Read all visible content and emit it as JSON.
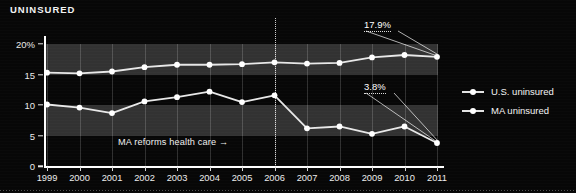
{
  "chart": {
    "title": "UNINSURED"
  },
  "chart_data": {
    "type": "line",
    "title": "UNINSURED",
    "xlabel": "",
    "ylabel": "",
    "x": [
      1999,
      2000,
      2001,
      2002,
      2003,
      2004,
      2005,
      2006,
      2007,
      2008,
      2009,
      2010,
      2011
    ],
    "xtick_labels": [
      "1999",
      "2000",
      "2001",
      "2002",
      "2003",
      "2004",
      "2005",
      "2006",
      "2007",
      "2008",
      "2009",
      "2010",
      "2011"
    ],
    "ytick_labels": [
      "0",
      "5",
      "10",
      "15",
      "20%"
    ],
    "ytick_values": [
      0,
      5,
      10,
      15,
      20
    ],
    "ylim": [
      0,
      22
    ],
    "grid": "vertical",
    "legend_position": "right",
    "series": [
      {
        "name": "U.S. uninsured",
        "color": "#e8e8e8",
        "values": [
          15.3,
          15.2,
          15.5,
          16.2,
          16.6,
          16.6,
          16.7,
          17.0,
          16.8,
          16.9,
          17.8,
          18.2,
          17.9
        ]
      },
      {
        "name": "MA uninsured",
        "color": "#e8e8e8",
        "values": [
          10.1,
          9.6,
          8.7,
          10.6,
          11.3,
          12.2,
          10.5,
          11.6,
          6.2,
          6.5,
          5.3,
          6.5,
          3.8
        ]
      }
    ],
    "shaded_bands": [
      {
        "from": 15,
        "to": 20
      },
      {
        "from": 5,
        "to": 10
      }
    ],
    "annotations": [
      {
        "label": "17.9%",
        "points_to_x": 2011,
        "points_to_y": 17.9
      },
      {
        "label": "3.8%",
        "points_to_x": 2011,
        "points_to_y": 3.8
      },
      {
        "label": "MA reforms health care →",
        "at_x": 2006
      }
    ],
    "reference_line": {
      "x": 2006,
      "style": "dotted"
    }
  },
  "legend": {
    "items": [
      {
        "label": "U.S. uninsured"
      },
      {
        "label": "MA uninsured"
      }
    ]
  },
  "annotations": {
    "us_end_label": "17.9%",
    "ma_end_label": "3.8%",
    "reform_note": "MA reforms health care →"
  }
}
